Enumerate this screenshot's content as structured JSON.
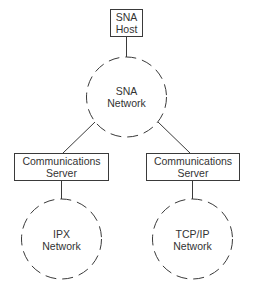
{
  "diagram": {
    "stroke_color": "#3a3a3a",
    "nodes": {
      "host": {
        "line1": "SNA",
        "line2": "Host"
      },
      "sna_network": {
        "line1": "SNA",
        "line2": "Network"
      },
      "server_left": {
        "line1": "Communications",
        "line2": "Server"
      },
      "server_right": {
        "line1": "Communications",
        "line2": "Server"
      },
      "ipx_network": {
        "line1": "IPX",
        "line2": "Network"
      },
      "tcpip_network": {
        "line1": "TCP/IP",
        "line2": "Network"
      }
    },
    "edges": [
      {
        "from": "SNA Host",
        "to": "SNA Network"
      },
      {
        "from": "SNA Network",
        "to": "Communications Server (left)"
      },
      {
        "from": "SNA Network",
        "to": "Communications Server (right)"
      },
      {
        "from": "Communications Server (left)",
        "to": "IPX Network"
      },
      {
        "from": "Communications Server (right)",
        "to": "TCP/IP Network"
      }
    ]
  }
}
